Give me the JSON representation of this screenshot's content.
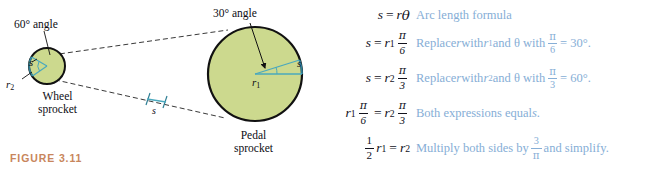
{
  "figure": {
    "caption": "FIGURE 3.11",
    "caption_color": "#c8865c",
    "sprocket_fill": "#ccd98e",
    "sprocket_stroke": "#111111",
    "radius_line_color": "#4aa8bd",
    "chain_line_color": "#3a3a3a",
    "labels": {
      "angle_small": "60° angle",
      "angle_large": "30° angle",
      "wheel_sprocket_line1": "Wheel",
      "wheel_sprocket_line2": "sprocket",
      "pedal_sprocket_line1": "Pedal",
      "pedal_sprocket_line2": "sprocket",
      "arc_small": "s",
      "radius_small": "r",
      "radius_small_sub": "2",
      "arc_chain": "s",
      "arc_large": "s",
      "radius_large": "r",
      "radius_large_sub": "1"
    }
  },
  "derivation": {
    "rows": [
      {
        "equation": {
          "lhs": "s",
          "op": "=",
          "rhs_var": "r",
          "rhs_theta": "θ"
        },
        "note": "Arc length formula"
      },
      {
        "equation": {
          "lhs": "s",
          "op": "=",
          "rhs_var": "r",
          "rhs_sub": "1",
          "frac_num": "π",
          "frac_den": "6"
        },
        "note_before": "Replace ",
        "note_r": "r",
        "note_mid1": " with ",
        "note_r_sub_var": "r",
        "note_r_sub": "1",
        "note_mid2": " and θ with ",
        "note_frac_num": "π",
        "note_frac_den": "6",
        "note_equals": " = 30°."
      },
      {
        "equation": {
          "lhs": "s",
          "op": "=",
          "rhs_var": "r",
          "rhs_sub": "2",
          "frac_num": "π",
          "frac_den": "3"
        },
        "note_before": "Replace ",
        "note_r": "r",
        "note_mid1": " with ",
        "note_r_sub_var": "r",
        "note_r_sub": "2",
        "note_mid2": " and θ with ",
        "note_frac_num": "π",
        "note_frac_den": "3",
        "note_equals": " = 60°."
      },
      {
        "equation": {
          "lhs_var": "r",
          "lhs_sub": "1",
          "lhs_frac_num": "π",
          "lhs_frac_den": "6",
          "op": "=",
          "rhs_var": "r",
          "rhs_sub": "2",
          "frac_num": "π",
          "frac_den": "3"
        },
        "note_before": "Both expressions equal ",
        "note_s": "s",
        "note_after": "."
      },
      {
        "equation": {
          "lhs_frac_num": "1",
          "lhs_frac_den": "2",
          "lhs_var": "r",
          "lhs_sub": "1",
          "op": "=",
          "rhs_var": "r",
          "rhs_sub": "2"
        },
        "note_before": "Multiply both sides by ",
        "note_frac_num": "3",
        "note_frac_den": "π",
        "note_after": " and simplify."
      }
    ]
  }
}
